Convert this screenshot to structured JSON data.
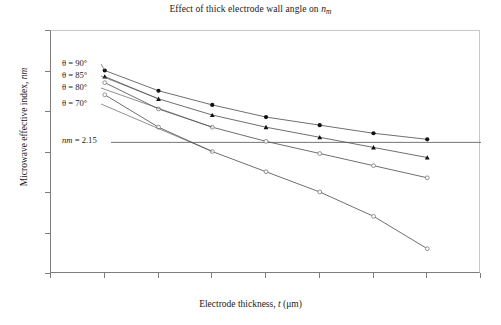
{
  "chart_data": {
    "type": "line",
    "title_main": "Effect of thick electrode wall angle on ",
    "title_var": "n",
    "title_varsub": "m",
    "xlabel": "Electrode thickness, t (μm)",
    "xlabel_pre": "Electrode thickness, ",
    "xlabel_var": "t",
    "xlabel_post": " (μm)",
    "ylabel": "Microwave effective index, n_m",
    "ylabel_pre": "Microwave effective index, ",
    "ylabel_var": "n",
    "ylabel_varsub": "m",
    "xlim": [
      6,
      22
    ],
    "ylim": [
      1.5,
      2.7
    ],
    "xticks": [
      6,
      8,
      10,
      12,
      14,
      16,
      18,
      20,
      22
    ],
    "yticks": [
      1.5,
      1.7,
      1.9,
      2.1,
      2.3,
      2.5,
      2.7
    ],
    "grid": false,
    "legend_position": "inline-annotations",
    "x": [
      8,
      10,
      12,
      14,
      16,
      18,
      20
    ],
    "series": [
      {
        "name": "θ = 90°",
        "label": "θ = 90°",
        "marker": "circle",
        "values": [
          2.505,
          2.405,
          2.335,
          2.275,
          2.235,
          2.195,
          2.165
        ]
      },
      {
        "name": "θ = 85°",
        "label": "θ = 85°",
        "marker": "triangle",
        "values": [
          2.475,
          2.365,
          2.285,
          2.225,
          2.175,
          2.125,
          2.075
        ]
      },
      {
        "name": "θ = 80°",
        "label": "θ = 80°",
        "marker": "open-circle",
        "values": [
          2.445,
          2.315,
          2.225,
          2.155,
          2.095,
          2.035,
          1.975
        ]
      },
      {
        "name": "θ = 70°",
        "label": "θ = 70°",
        "marker": "open-circle",
        "values": [
          2.385,
          2.225,
          2.105,
          2.005,
          1.905,
          1.785,
          1.625
        ]
      }
    ],
    "reference_line": {
      "label": "n_m = 2.15",
      "label_var": "n",
      "label_varsub": "m",
      "label_rest": " = 2.15",
      "value": 2.15,
      "orientation": "horizontal"
    },
    "colors": {
      "line": "#555555",
      "marker_filled": "#111111",
      "marker_open": "#777777",
      "axis": "#7d7d7d",
      "reference": "#666666"
    }
  }
}
